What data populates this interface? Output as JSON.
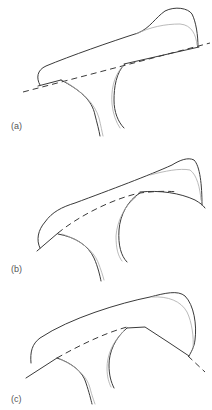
{
  "figure": {
    "panels": [
      {
        "id": "a",
        "label": "(a)",
        "description": "Outline with straight dashed reference line tangent beneath the bar"
      },
      {
        "id": "b",
        "label": "(b)",
        "description": "Outline with curved dashed reference line arching beneath the bar"
      },
      {
        "id": "c",
        "label": "(c)",
        "description": "Outline with angled dashed reference line meeting the bar's lower edge"
      }
    ]
  },
  "colors": {
    "outline": "#3a3a3a",
    "secondary_outline": "#a8a8a8",
    "label": "#555555",
    "background": "#ffffff"
  }
}
